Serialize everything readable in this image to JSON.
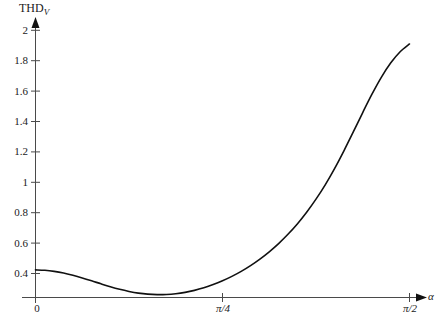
{
  "chart_data": {
    "type": "line",
    "title": "",
    "xlabel": "α",
    "ylabel": "THD",
    "ylabel_sub": "V",
    "xlim": [
      0,
      1.5707963
    ],
    "ylim": [
      0.22,
      2.0
    ],
    "grid": false,
    "legend": null,
    "x_ticks": [
      {
        "value": 0,
        "label": "0"
      },
      {
        "value": 0.7853982,
        "label": "π/4"
      },
      {
        "value": 1.5707963,
        "label": "π/2"
      }
    ],
    "y_ticks": [
      {
        "value": 0.4,
        "label": "0.4"
      },
      {
        "value": 0.6,
        "label": "0.6"
      },
      {
        "value": 0.8,
        "label": "0.8"
      },
      {
        "value": 1.0,
        "label": "1"
      },
      {
        "value": 1.2,
        "label": "1.2"
      },
      {
        "value": 1.4,
        "label": "1.4"
      },
      {
        "value": 1.6,
        "label": "1.6"
      },
      {
        "value": 1.8,
        "label": "1.8"
      },
      {
        "value": 2.0,
        "label": "2"
      }
    ],
    "series": [
      {
        "name": "THD_V",
        "color": "#111111",
        "x": [
          0.0,
          0.0393,
          0.0785,
          0.1178,
          0.1571,
          0.1963,
          0.2356,
          0.2749,
          0.3142,
          0.3534,
          0.3927,
          0.432,
          0.4712,
          0.5105,
          0.5498,
          0.589,
          0.6283,
          0.6676,
          0.7069,
          0.7461,
          0.7854,
          0.8247,
          0.8639,
          0.9032,
          0.9425,
          0.9817,
          1.021,
          1.0603,
          1.0996,
          1.1388,
          1.1781,
          1.2174,
          1.2566,
          1.2959,
          1.3352,
          1.3744,
          1.4137,
          1.453,
          1.4923,
          1.5315,
          1.5708
        ],
        "y": [
          0.424,
          0.421,
          0.414,
          0.403,
          0.388,
          0.371,
          0.352,
          0.332,
          0.313,
          0.296,
          0.282,
          0.271,
          0.264,
          0.261,
          0.262,
          0.267,
          0.276,
          0.289,
          0.306,
          0.327,
          0.352,
          0.381,
          0.414,
          0.452,
          0.495,
          0.543,
          0.597,
          0.658,
          0.726,
          0.803,
          0.889,
          0.985,
          1.092,
          1.209,
          1.333,
          1.459,
          1.581,
          1.692,
          1.786,
          1.859,
          1.91
        ]
      }
    ],
    "annotations": {
      "start_value": 0.424,
      "minimum": {
        "x": 0.5105,
        "y": 0.261
      },
      "value_at_pi_over_4": 0.352,
      "end_value": 1.99,
      "note": "THD_V versus firing angle alpha"
    }
  },
  "axes": {
    "y_axis_name": "vertical-axis",
    "x_axis_name": "horizontal-axis",
    "y_arrow": "up-arrow",
    "x_arrow": "right-arrow"
  }
}
